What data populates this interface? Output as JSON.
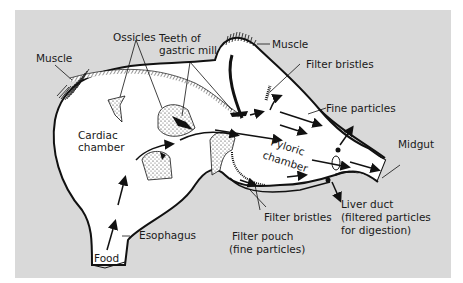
{
  "figure": {
    "background_color": "#d9d9d9",
    "organ_fill": "#ffffff",
    "line_color": "#111111"
  },
  "labels": {
    "muscle_left": "Muscle",
    "ossicles": "Ossicles",
    "teeth_line1": "Teeth of",
    "teeth_line2": "gastric mill",
    "muscle_right": "Muscle",
    "filter_bristles_top": "Filter bristles",
    "fine_particles": "Fine particles",
    "cardiac_line1": "Cardiac",
    "cardiac_line2": "chamber",
    "pyloric_line1": "Pyloric",
    "pyloric_line2": "chamber",
    "midgut": "Midgut",
    "liver_line1": "Liver duct",
    "liver_line2": "(filtered particles",
    "liver_line3": "for digestion)",
    "filter_bristles_bottom": "Filter bristles",
    "filter_pouch_line1": "Filter pouch",
    "filter_pouch_line2": "(fine particles)",
    "esophagus": "Esophagus",
    "food": "Food"
  }
}
